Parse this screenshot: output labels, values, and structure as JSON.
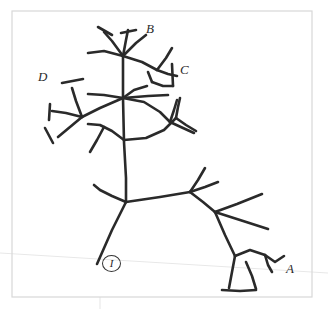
{
  "figure": {
    "kind": "hand-drawn-skeletal-structure-sketch",
    "background_color": "#ffffff",
    "ink_color": "#2a2a2a",
    "frame_color": "#d8d8d8",
    "guide_color": "#e8e8e8"
  },
  "frame": {
    "x": 12,
    "y": 11,
    "width": 300,
    "height": 286
  },
  "guides": {
    "horizon_line": {
      "x1": 0,
      "y1": 253,
      "x2": 328,
      "y2": 273
    },
    "vertical_tick": {
      "x1": 100,
      "y1": 297,
      "x2": 100,
      "y2": 309
    }
  },
  "labels": [
    {
      "id": "label-b",
      "text": "B",
      "x": 146,
      "y": 22,
      "size": "big"
    },
    {
      "id": "label-c",
      "text": "C",
      "x": 180,
      "y": 63,
      "size": "big"
    },
    {
      "id": "label-d",
      "text": "D",
      "x": 38,
      "y": 70,
      "size": "big"
    },
    {
      "id": "label-a",
      "text": "A",
      "x": 286,
      "y": 262,
      "size": "big"
    }
  ],
  "circled_labels": [
    {
      "id": "label-i-circled",
      "text": "I",
      "x": 102,
      "y": 255
    }
  ],
  "strokes": [
    {
      "name": "main-trunk-upper",
      "d": "M 123 98 L 124 142 L 126 178 L 126 202",
      "w": 2.6
    },
    {
      "name": "trunk-upper-to-crown",
      "d": "M 123 98 L 123 76 L 123 56",
      "w": 2.6
    },
    {
      "name": "crown-branch-up-left",
      "d": "M 123 56 L 112 41 L 104 32",
      "w": 2.6
    },
    {
      "name": "crown-cap-up-left",
      "d": "M 98 27 L 112 35",
      "w": 2.6
    },
    {
      "name": "crown-branch-up-mid",
      "d": "M 123 56 L 126 40 L 128 30",
      "w": 2.6
    },
    {
      "name": "crown-cap-up-mid",
      "d": "M 121 33 L 136 30",
      "w": 2.6
    },
    {
      "name": "crown-branch-up-right",
      "d": "M 123 56 L 136 43 L 146 35",
      "w": 2.6
    },
    {
      "name": "crown-branch-left-horiz",
      "d": "M 123 56 L 104 51 L 88 53",
      "w": 2.6
    },
    {
      "name": "crown-branch-right-down",
      "d": "M 123 56 L 142 62 L 157 70",
      "w": 2.6
    },
    {
      "name": "c-branch-stem",
      "d": "M 157 70 L 166 58 L 172 48",
      "w": 2.6
    },
    {
      "name": "c-branch-fork-a",
      "d": "M 157 70 L 168 74 L 177 76",
      "w": 2.6
    },
    {
      "name": "c-branch-cap",
      "d": "M 172 64 L 173 86",
      "w": 2.6
    },
    {
      "name": "c-branch-lower",
      "d": "M 152 82 L 163 86 L 173 86",
      "w": 2.6
    },
    {
      "name": "c-branch-connector",
      "d": "M 148 72 L 152 82",
      "w": 2.6
    },
    {
      "name": "mid-node-branch-upright",
      "d": "M 123 98 L 134 90 L 147 86",
      "w": 2.6
    },
    {
      "name": "mid-node-branch-right",
      "d": "M 123 98 L 148 96 L 168 95",
      "w": 2.6
    },
    {
      "name": "mid-node-branch-left-up",
      "d": "M 123 98 L 104 95 L 88 94",
      "w": 2.6
    },
    {
      "name": "mid-node-branch-left-down",
      "d": "M 123 98 L 100 108 L 82 117",
      "w": 2.6
    },
    {
      "name": "d-node-stem-up",
      "d": "M 82 117 L 76 101 L 72 88",
      "w": 2.6
    },
    {
      "name": "d-node-cap-up",
      "d": "M 62 83 L 83 79",
      "w": 2.6
    },
    {
      "name": "d-node-branch-left",
      "d": "M 82 117 L 66 113 L 52 111",
      "w": 2.6
    },
    {
      "name": "d-node-cap-left",
      "d": "M 50 104 L 49 120",
      "w": 2.6
    },
    {
      "name": "d-node-branch-down",
      "d": "M 82 117 L 70 127 L 58 137",
      "w": 2.6
    },
    {
      "name": "d-node-cap-down",
      "d": "M 45 128 L 53 143",
      "w": 2.6
    },
    {
      "name": "mid-right-sweep",
      "d": "M 123 98 L 144 102 L 160 112 L 170 122",
      "w": 2.6
    },
    {
      "name": "mid-right-up",
      "d": "M 170 122 L 174 110 L 177 100",
      "w": 2.6
    },
    {
      "name": "mid-right-down",
      "d": "M 170 122 L 183 128 L 194 133",
      "w": 2.6
    },
    {
      "name": "lower-crown-sweep-left",
      "d": "M 124 140 L 112 131 L 100 125 L 88 124",
      "w": 2.6
    },
    {
      "name": "lower-crown-spur",
      "d": "M 104 127 L 97 140 L 90 152",
      "w": 2.6
    },
    {
      "name": "lower-crown-sweep-right",
      "d": "M 124 140 L 146 138 L 164 130 L 176 118",
      "w": 2.6
    },
    {
      "name": "lower-crown-right-up",
      "d": "M 176 118 L 178 107 L 180 98",
      "w": 2.6
    },
    {
      "name": "lower-crown-right-down",
      "d": "M 176 118 L 186 125 L 196 131",
      "w": 2.6
    },
    {
      "name": "base-sweep-left",
      "d": "M 126 202 L 112 196 L 100 190 L 94 185",
      "w": 2.6
    },
    {
      "name": "base-branch-right",
      "d": "M 126 202 L 160 197 L 190 192",
      "w": 2.6
    },
    {
      "name": "right-node-up",
      "d": "M 190 192 L 198 180 L 205 168",
      "w": 2.6
    },
    {
      "name": "right-node-up-right",
      "d": "M 190 192 L 205 187 L 218 182",
      "w": 2.6
    },
    {
      "name": "right-node-down",
      "d": "M 190 192 L 203 202 L 215 212",
      "w": 2.6
    },
    {
      "name": "far-right-node-up",
      "d": "M 215 212 L 237 204 L 262 194",
      "w": 2.6
    },
    {
      "name": "far-right-node-down",
      "d": "M 215 212 L 240 220 L 268 229",
      "w": 2.6
    },
    {
      "name": "far-right-leg",
      "d": "M 215 212 L 225 235 L 235 256",
      "w": 2.6
    },
    {
      "name": "foot-left-post",
      "d": "M 235 256 L 232 272 L 229 288",
      "w": 2.6
    },
    {
      "name": "foot-base",
      "d": "M 222 290 L 240 291 L 256 290",
      "w": 2.6
    },
    {
      "name": "foot-right-post",
      "d": "M 246 262 L 252 276 L 256 289",
      "w": 2.6
    },
    {
      "name": "foot-span",
      "d": "M 235 256 L 250 250 L 265 255",
      "w": 2.6
    },
    {
      "name": "foot-hook-down",
      "d": "M 265 255 L 268 265 L 272 272",
      "w": 2.6
    },
    {
      "name": "foot-hook-up",
      "d": "M 265 255 L 275 262 L 284 256",
      "w": 2.6
    },
    {
      "name": "trunk-bottom-leg",
      "d": "M 126 202 L 112 230 L 97 264",
      "w": 2.6
    }
  ]
}
